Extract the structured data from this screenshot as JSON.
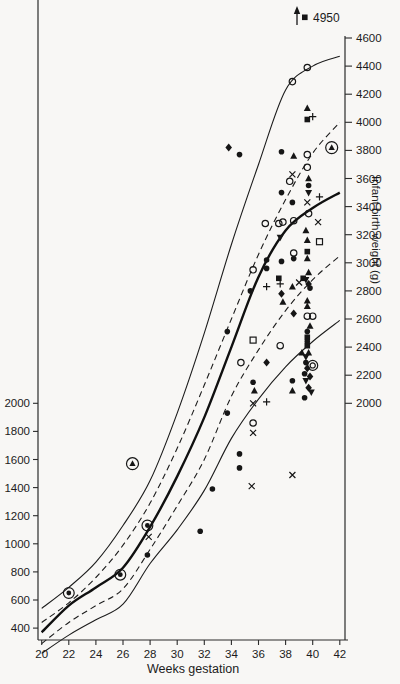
{
  "figure": {
    "background": "#f8f7f5",
    "ink": "#1c1c1c"
  },
  "chart_data": {
    "type": "scatter",
    "title": "",
    "xlabel": "Weeks gestation",
    "ylabel": "Infant birth weight (g)",
    "x_ticks": [
      20,
      22,
      24,
      26,
      28,
      30,
      32,
      34,
      36,
      38,
      40,
      42
    ],
    "xlim": [
      19.7,
      42.6
    ],
    "left_axis_ticks": [
      2000,
      1800,
      1600,
      1400,
      1200,
      1000,
      800,
      600,
      400
    ],
    "right_axis_ticks": [
      4600,
      4400,
      4200,
      4000,
      3800,
      3600,
      3400,
      3200,
      3000,
      2800,
      2600,
      2400,
      2200,
      2000
    ],
    "grid": false,
    "legend": false,
    "curve_weeks": [
      20,
      22,
      24,
      26,
      28,
      30,
      32,
      34,
      36,
      38,
      40,
      42
    ],
    "curves": [
      {
        "name": "upper-outer-percentile",
        "style": "thin-solid",
        "values": [
          540,
          690,
          870,
          1130,
          1450,
          1930,
          2500,
          3130,
          3700,
          4230,
          4400,
          4470
        ]
      },
      {
        "name": "upper-inner-percentile",
        "style": "dashed",
        "values": [
          440,
          580,
          760,
          990,
          1290,
          1680,
          2130,
          2600,
          3060,
          3450,
          3780,
          4000
        ]
      },
      {
        "name": "mean-curve",
        "style": "thick-solid",
        "values": [
          370,
          560,
          690,
          830,
          1120,
          1480,
          1900,
          2400,
          2900,
          3230,
          3390,
          3500
        ]
      },
      {
        "name": "lower-inner-percentile",
        "style": "dashed",
        "values": [
          290,
          440,
          560,
          680,
          960,
          1270,
          1600,
          2050,
          2380,
          2660,
          2880,
          3050
        ]
      },
      {
        "name": "lower-outer-percentile",
        "style": "thin-solid",
        "values": [
          220,
          350,
          460,
          570,
          860,
          1100,
          1380,
          1750,
          2030,
          2260,
          2440,
          2590
        ]
      }
    ],
    "offscale_annotation": {
      "marker": "sq",
      "arrow": "up",
      "label": "4950",
      "week": 40,
      "weight": 4950
    },
    "points": [
      {
        "m": "circle",
        "wk": 39.6,
        "g": 4390
      },
      {
        "m": "circle",
        "wk": 38.5,
        "g": 4290
      },
      {
        "m": "tri",
        "wk": 39.6,
        "g": 4100
      },
      {
        "m": "plus",
        "wk": 40.0,
        "g": 4040
      },
      {
        "m": "sq",
        "wk": 39.6,
        "g": 4020
      },
      {
        "m": "diamond",
        "wk": 33.8,
        "g": 3820
      },
      {
        "m": "tri-circled",
        "wk": 41.4,
        "g": 3820
      },
      {
        "m": "dot",
        "wk": 34.6,
        "g": 3770
      },
      {
        "m": "dot",
        "wk": 37.7,
        "g": 3790
      },
      {
        "m": "tri",
        "wk": 38.6,
        "g": 3760
      },
      {
        "m": "circle",
        "wk": 39.6,
        "g": 3770
      },
      {
        "m": "circle",
        "wk": 39.6,
        "g": 3680
      },
      {
        "m": "x",
        "wk": 38.5,
        "g": 3630
      },
      {
        "m": "circle",
        "wk": 38.3,
        "g": 3580
      },
      {
        "m": "tri",
        "wk": 39.7,
        "g": 3600
      },
      {
        "m": "dot",
        "wk": 39.7,
        "g": 3550
      },
      {
        "m": "tri-down",
        "wk": 39.7,
        "g": 3500
      },
      {
        "m": "dot",
        "wk": 37.7,
        "g": 3500
      },
      {
        "m": "plus",
        "wk": 40.5,
        "g": 3470
      },
      {
        "m": "x",
        "wk": 39.6,
        "g": 3430
      },
      {
        "m": "dot",
        "wk": 38.5,
        "g": 3430
      },
      {
        "m": "circle",
        "wk": 39.7,
        "g": 3350
      },
      {
        "m": "circle",
        "wk": 36.5,
        "g": 3280
      },
      {
        "m": "circle",
        "wk": 37.5,
        "g": 3280
      },
      {
        "m": "circle",
        "wk": 37.8,
        "g": 3290
      },
      {
        "m": "circle",
        "wk": 38.6,
        "g": 3300
      },
      {
        "m": "x",
        "wk": 40.4,
        "g": 3290
      },
      {
        "m": "tri",
        "wk": 39.5,
        "g": 3230
      },
      {
        "m": "tri-down",
        "wk": 37.6,
        "g": 3180
      },
      {
        "m": "tri",
        "wk": 39.6,
        "g": 3160
      },
      {
        "m": "sq-open",
        "wk": 40.5,
        "g": 3150
      },
      {
        "m": "sq",
        "wk": 39.6,
        "g": 3080
      },
      {
        "m": "circle",
        "wk": 38.6,
        "g": 3070
      },
      {
        "m": "tri",
        "wk": 39.6,
        "g": 3030
      },
      {
        "m": "dot",
        "wk": 38.6,
        "g": 3030
      },
      {
        "m": "dot",
        "wk": 36.6,
        "g": 3020
      },
      {
        "m": "dot",
        "wk": 36.6,
        "g": 2960
      },
      {
        "m": "dot",
        "wk": 37.7,
        "g": 3010
      },
      {
        "m": "circle",
        "wk": 35.6,
        "g": 2950
      },
      {
        "m": "sq",
        "wk": 37.5,
        "g": 2890
      },
      {
        "m": "tri",
        "wk": 39.7,
        "g": 2930
      },
      {
        "m": "sq",
        "wk": 39.3,
        "g": 2890
      },
      {
        "m": "tri-down",
        "wk": 39.5,
        "g": 2880
      },
      {
        "m": "x",
        "wk": 39.0,
        "g": 2860
      },
      {
        "m": "diamond",
        "wk": 39.7,
        "g": 2850
      },
      {
        "m": "plus",
        "wk": 36.6,
        "g": 2830
      },
      {
        "m": "plus",
        "wk": 37.6,
        "g": 2850
      },
      {
        "m": "tri",
        "wk": 38.5,
        "g": 2830
      },
      {
        "m": "diamond",
        "wk": 37.7,
        "g": 2780
      },
      {
        "m": "dot",
        "wk": 35.4,
        "g": 2800
      },
      {
        "m": "dot",
        "wk": 39.8,
        "g": 2820
      },
      {
        "m": "tri",
        "wk": 37.8,
        "g": 2720
      },
      {
        "m": "tri",
        "wk": 39.6,
        "g": 2730
      },
      {
        "m": "tri",
        "wk": 39.6,
        "g": 2690
      },
      {
        "m": "diamond",
        "wk": 38.6,
        "g": 2640
      },
      {
        "m": "circle",
        "wk": 39.6,
        "g": 2620
      },
      {
        "m": "circle",
        "wk": 40.0,
        "g": 2620
      },
      {
        "m": "tri",
        "wk": 39.8,
        "g": 2550
      },
      {
        "m": "dot",
        "wk": 33.7,
        "g": 2510
      },
      {
        "m": "dot",
        "wk": 39.6,
        "g": 2510
      },
      {
        "m": "sq",
        "wk": 39.6,
        "g": 2470
      },
      {
        "m": "dot",
        "wk": 39.6,
        "g": 2440
      },
      {
        "m": "sq",
        "wk": 39.6,
        "g": 2410
      },
      {
        "m": "sq-open",
        "wk": 35.6,
        "g": 2450
      },
      {
        "m": "circle",
        "wk": 37.6,
        "g": 2410
      },
      {
        "m": "tri",
        "wk": 39.2,
        "g": 2360
      },
      {
        "m": "tri",
        "wk": 39.7,
        "g": 2360
      },
      {
        "m": "tri-down",
        "wk": 39.5,
        "g": 2330
      },
      {
        "m": "dot",
        "wk": 39.5,
        "g": 2290
      },
      {
        "m": "circle-double",
        "wk": 40.0,
        "g": 2270
      },
      {
        "m": "circle",
        "wk": 34.7,
        "g": 2290
      },
      {
        "m": "diamond",
        "wk": 36.6,
        "g": 2290
      },
      {
        "m": "diamond",
        "wk": 39.6,
        "g": 2250
      },
      {
        "m": "dot",
        "wk": 39.4,
        "g": 2210
      },
      {
        "m": "diamond",
        "wk": 39.8,
        "g": 2190
      },
      {
        "m": "tri-down",
        "wk": 39.5,
        "g": 2160
      },
      {
        "m": "dot",
        "wk": 35.6,
        "g": 2150
      },
      {
        "m": "dot",
        "wk": 38.5,
        "g": 2160
      },
      {
        "m": "diamond",
        "wk": 39.7,
        "g": 2110
      },
      {
        "m": "tri",
        "wk": 35.7,
        "g": 2090
      },
      {
        "m": "tri",
        "wk": 38.5,
        "g": 2090
      },
      {
        "m": "tri-down",
        "wk": 39.9,
        "g": 2080
      },
      {
        "m": "dot",
        "wk": 39.4,
        "g": 2040
      },
      {
        "m": "x",
        "wk": 35.6,
        "g": 2000
      },
      {
        "m": "plus",
        "wk": 36.6,
        "g": 2010
      },
      {
        "m": "dot",
        "wk": 33.7,
        "g": 1930
      },
      {
        "m": "circle",
        "wk": 35.6,
        "g": 1860
      },
      {
        "m": "x",
        "wk": 35.6,
        "g": 1790
      },
      {
        "m": "dot",
        "wk": 34.6,
        "g": 1640
      },
      {
        "m": "tri-circled",
        "wk": 26.7,
        "g": 1570
      },
      {
        "m": "dot",
        "wk": 34.6,
        "g": 1540
      },
      {
        "m": "x",
        "wk": 38.5,
        "g": 1490
      },
      {
        "m": "x",
        "wk": 35.5,
        "g": 1410
      },
      {
        "m": "dot",
        "wk": 32.6,
        "g": 1390
      },
      {
        "m": "dot-circled",
        "wk": 27.8,
        "g": 1130
      },
      {
        "m": "x",
        "wk": 27.9,
        "g": 1050
      },
      {
        "m": "dot",
        "wk": 31.7,
        "g": 1090
      },
      {
        "m": "dot",
        "wk": 27.8,
        "g": 920
      },
      {
        "m": "dot-circled",
        "wk": 25.8,
        "g": 780
      },
      {
        "m": "dot-circled",
        "wk": 22.0,
        "g": 650
      }
    ]
  }
}
